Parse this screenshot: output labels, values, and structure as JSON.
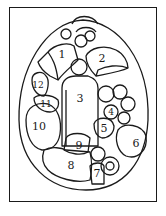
{
  "diagram": {
    "type": "still-life key",
    "line_color": "#1a1a1a",
    "background": "#ffffff",
    "labels": [
      {
        "id": "1",
        "x": 62,
        "y": 54
      },
      {
        "id": "2",
        "x": 102,
        "y": 58
      },
      {
        "id": "3",
        "x": 80,
        "y": 98
      },
      {
        "id": "4",
        "x": 111,
        "y": 112
      },
      {
        "id": "5",
        "x": 104,
        "y": 128
      },
      {
        "id": "6",
        "x": 136,
        "y": 143
      },
      {
        "id": "7",
        "x": 97,
        "y": 173
      },
      {
        "id": "8",
        "x": 71,
        "y": 165
      },
      {
        "id": "9",
        "x": 79,
        "y": 145
      },
      {
        "id": "10",
        "x": 39,
        "y": 126
      },
      {
        "id": "11",
        "x": 46,
        "y": 104
      },
      {
        "id": "12",
        "x": 38,
        "y": 85
      }
    ]
  }
}
